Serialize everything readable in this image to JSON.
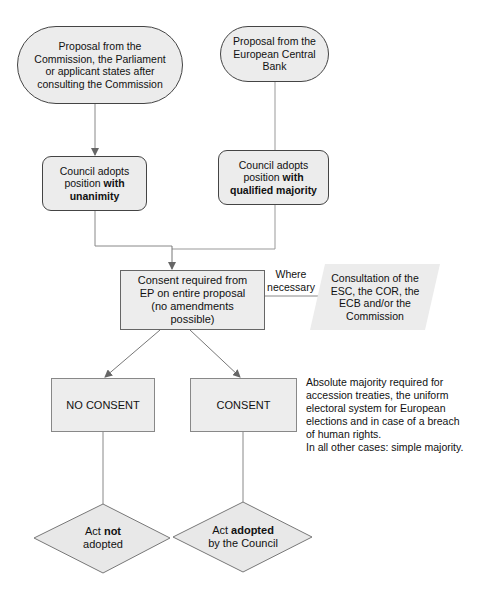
{
  "diagram": {
    "nodes": {
      "proposal_commission": {
        "text": "Proposal from the Commission, the Parliament or applicant states after consulting the Commission",
        "lines": [
          "Proposal from the",
          "Commission, the Parliament",
          "or applicant states after",
          "consulting the Commission"
        ],
        "shape": "rounded-terminal"
      },
      "proposal_ecb": {
        "text": "Proposal from the European Central Bank",
        "lines": [
          "Proposal from the",
          "European Central",
          "Bank"
        ],
        "shape": "rounded-terminal"
      },
      "council_unanimity": {
        "line1": "Council adopts",
        "line2_normal": "position ",
        "line2_bold": "with",
        "line3_bold": "unanimity",
        "shape": "rounded-rectangle"
      },
      "council_qmv": {
        "line1": "Council adopts",
        "line2_normal": "position ",
        "line2_bold": "with",
        "line3_bold": "qualified majority",
        "shape": "rounded-rectangle"
      },
      "consent_required": {
        "lines": [
          "Consent required from",
          "EP on entire proposal",
          "(no amendments",
          "possible)"
        ],
        "shape": "rectangle"
      },
      "consultation": {
        "lines": [
          "Consultation of the",
          "ESC, the COR, the",
          "ECB and/or the",
          "Commission"
        ],
        "shape": "parallelogram"
      },
      "no_consent": {
        "text": "NO CONSENT",
        "shape": "rectangle"
      },
      "consent": {
        "text": "CONSENT",
        "shape": "rectangle"
      },
      "act_not_adopted": {
        "line1_normal": "Act ",
        "line1_bold": "not",
        "line2": "adopted",
        "shape": "diamond"
      },
      "act_adopted": {
        "line1_normal": "Act ",
        "line1_bold": "adopted",
        "line2": "by the Council",
        "shape": "diamond"
      }
    },
    "edge_labels": {
      "where_necessary": [
        "Where",
        "necessary"
      ]
    },
    "note": {
      "lines": [
        "Absolute majority required for",
        "accession treaties, the uniform",
        "electoral system for European",
        "elections and in case of a breach",
        "of human rights.",
        "In all other cases: simple majority."
      ]
    },
    "edges": [
      {
        "from": "proposal_commission",
        "to": "council_unanimity"
      },
      {
        "from": "proposal_ecb",
        "to": "council_qmv"
      },
      {
        "from": "council_unanimity",
        "to": "consent_required"
      },
      {
        "from": "council_qmv",
        "to": "consent_required"
      },
      {
        "from": "consent_required",
        "to": "consultation",
        "label": "Where necessary"
      },
      {
        "from": "consent_required",
        "to": "no_consent"
      },
      {
        "from": "consent_required",
        "to": "consent"
      },
      {
        "from": "no_consent",
        "to": "act_not_adopted"
      },
      {
        "from": "consent",
        "to": "act_adopted"
      }
    ],
    "colors": {
      "node_fill": "#ececec",
      "node_border": "#444444",
      "line": "#808080",
      "arrow": "#666666",
      "text": "#111111"
    }
  }
}
